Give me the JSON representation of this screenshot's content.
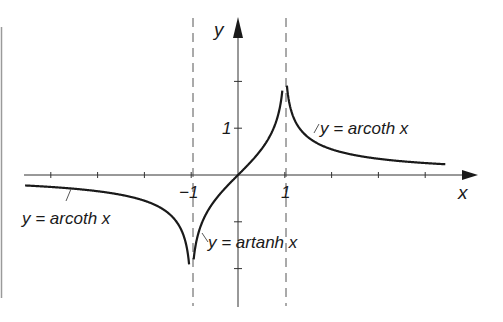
{
  "chart_data": {
    "type": "line",
    "title": "",
    "xlabel": "x",
    "ylabel": "y",
    "xlim": [
      -4.6,
      5.1
    ],
    "ylim": [
      -2.8,
      3.4
    ],
    "grid": false,
    "x_ticks": [
      -4,
      -3,
      -2,
      -1,
      0,
      1,
      2,
      3,
      4
    ],
    "y_ticks": [
      -2,
      -1,
      1,
      2
    ],
    "tick_labels": {
      "x": [
        {
          "value": -1,
          "text": "−1"
        },
        {
          "value": 1,
          "text": "1"
        }
      ],
      "y": [
        {
          "value": 1,
          "text": "1"
        }
      ]
    },
    "asymptotes": [
      {
        "x": -1,
        "style": "dashed"
      },
      {
        "x": 1,
        "style": "dashed"
      }
    ],
    "series": [
      {
        "name": "y = artanh x",
        "function": "artanh",
        "domain": [
          -0.947,
          0.947
        ],
        "color": "#1a1a1a"
      },
      {
        "name": "y = arcoth x",
        "function": "arcoth",
        "domain": [
          1.045,
          4.43
        ],
        "color": "#1a1a1a"
      },
      {
        "name": "y = arcoth x",
        "function": "arcoth",
        "domain": [
          -4.55,
          -1.045
        ],
        "color": "#1a1a1a"
      }
    ],
    "annotations": [
      {
        "text": "y = arcoth x",
        "x": 1.75,
        "y": 1.05,
        "leader_to": [
          1.6,
          0.9
        ]
      },
      {
        "text": "y = arcoth x",
        "x": -4.6,
        "y": -0.95,
        "leader_to": [
          -3.55,
          -0.3
        ]
      },
      {
        "text": "y = artanh x",
        "x": -0.6,
        "y": -1.5,
        "leader_to": [
          -0.78,
          -1.2
        ]
      }
    ]
  },
  "labels": {
    "x_axis": "x",
    "y_axis": "y",
    "x_neg_one": "−1",
    "x_one": "1",
    "y_one": "1",
    "arcoth_right": "y = arcoth x",
    "arcoth_left": "y = arcoth x",
    "artanh": "y = artanh x"
  }
}
